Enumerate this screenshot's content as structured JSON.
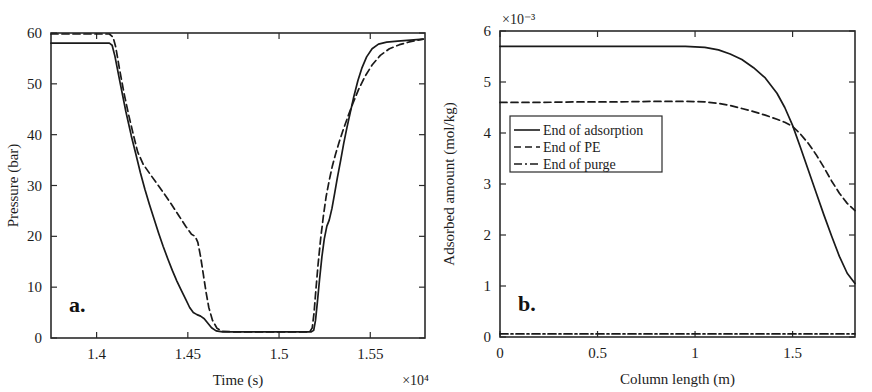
{
  "figure": {
    "width": 872,
    "height": 392,
    "background": "#ffffff",
    "ink_color": "#1a1a1a"
  },
  "chart_data": [
    {
      "id": "panel-a",
      "type": "line",
      "panel_label": "a.",
      "title": "",
      "xlabel": "Time (s)",
      "ylabel": "Pressure (bar)",
      "x_exponent": "×10⁴",
      "y_exponent": "",
      "xlim": [
        13750,
        15800
      ],
      "ylim": [
        0,
        60
      ],
      "xticks": [
        14000,
        14500,
        15000,
        15500
      ],
      "xticklabels": [
        "1.4",
        "1.45",
        "1.5",
        "1.55"
      ],
      "yticks": [
        0,
        10,
        20,
        30,
        40,
        50,
        60
      ],
      "yticklabels": [
        "0",
        "10",
        "20",
        "30",
        "40",
        "50",
        "60"
      ],
      "grid": false,
      "legend": "none",
      "series": [
        {
          "name": "solid-pressure",
          "style": "solid",
          "points": [
            [
              13750,
              58.0
            ],
            [
              13980,
              58.0
            ],
            [
              14070,
              58.0
            ],
            [
              14085,
              57.6
            ],
            [
              14100,
              55.5
            ],
            [
              14130,
              50.0
            ],
            [
              14160,
              44.6
            ],
            [
              14190,
              39.8
            ],
            [
              14215,
              36.2
            ],
            [
              14240,
              32.5
            ],
            [
              14265,
              29.2
            ],
            [
              14290,
              26.2
            ],
            [
              14315,
              23.4
            ],
            [
              14340,
              20.6
            ],
            [
              14365,
              18.0
            ],
            [
              14390,
              15.6
            ],
            [
              14415,
              13.3
            ],
            [
              14440,
              11.2
            ],
            [
              14465,
              9.3
            ],
            [
              14490,
              7.5
            ],
            [
              14510,
              6.0
            ],
            [
              14530,
              5.0
            ],
            [
              14550,
              4.6
            ],
            [
              14570,
              4.3
            ],
            [
              14590,
              3.8
            ],
            [
              14610,
              2.9
            ],
            [
              14630,
              2.0
            ],
            [
              14655,
              1.4
            ],
            [
              14690,
              1.2
            ],
            [
              14800,
              1.2
            ],
            [
              14960,
              1.2
            ],
            [
              15100,
              1.2
            ],
            [
              15175,
              1.2
            ],
            [
              15190,
              1.5
            ],
            [
              15200,
              3.5
            ],
            [
              15210,
              7.0
            ],
            [
              15222,
              11.5
            ],
            [
              15235,
              16.0
            ],
            [
              15248,
              19.5
            ],
            [
              15262,
              22.0
            ],
            [
              15275,
              23.2
            ],
            [
              15290,
              25.5
            ],
            [
              15305,
              28.5
            ],
            [
              15320,
              31.6
            ],
            [
              15338,
              35.0
            ],
            [
              15355,
              38.4
            ],
            [
              15372,
              41.4
            ],
            [
              15390,
              44.3
            ],
            [
              15410,
              47.5
            ],
            [
              15432,
              50.6
            ],
            [
              15455,
              53.2
            ],
            [
              15480,
              55.3
            ],
            [
              15510,
              56.9
            ],
            [
              15545,
              57.8
            ],
            [
              15590,
              58.2
            ],
            [
              15650,
              58.4
            ],
            [
              15720,
              58.6
            ],
            [
              15790,
              58.8
            ]
          ]
        },
        {
          "name": "dashed-pressure",
          "style": "dashed",
          "points": [
            [
              13750,
              59.8
            ],
            [
              13990,
              59.8
            ],
            [
              14070,
              59.8
            ],
            [
              14090,
              59.2
            ],
            [
              14105,
              57.2
            ],
            [
              14125,
              53.0
            ],
            [
              14150,
              48.2
            ],
            [
              14175,
              44.0
            ],
            [
              14200,
              40.2
            ],
            [
              14225,
              36.6
            ],
            [
              14255,
              34.2
            ],
            [
              14290,
              32.4
            ],
            [
              14330,
              30.4
            ],
            [
              14370,
              28.4
            ],
            [
              14410,
              26.3
            ],
            [
              14450,
              24.1
            ],
            [
              14490,
              21.9
            ],
            [
              14520,
              20.4
            ],
            [
              14540,
              20.0
            ],
            [
              14555,
              18.8
            ],
            [
              14570,
              16.0
            ],
            [
              14585,
              12.5
            ],
            [
              14600,
              9.0
            ],
            [
              14615,
              6.0
            ],
            [
              14635,
              3.5
            ],
            [
              14660,
              1.9
            ],
            [
              14690,
              1.3
            ],
            [
              14760,
              1.2
            ],
            [
              14900,
              1.2
            ],
            [
              15060,
              1.2
            ],
            [
              15150,
              1.2
            ],
            [
              15168,
              1.2
            ],
            [
              15182,
              2.0
            ],
            [
              15192,
              5.0
            ],
            [
              15202,
              9.5
            ],
            [
              15214,
              14.5
            ],
            [
              15228,
              19.5
            ],
            [
              15243,
              24.0
            ],
            [
              15258,
              27.8
            ],
            [
              15275,
              31.0
            ],
            [
              15292,
              33.8
            ],
            [
              15310,
              36.2
            ],
            [
              15330,
              38.6
            ],
            [
              15352,
              41.0
            ],
            [
              15378,
              43.6
            ],
            [
              15405,
              46.2
            ],
            [
              15435,
              48.8
            ],
            [
              15470,
              51.4
            ],
            [
              15510,
              53.7
            ],
            [
              15555,
              55.6
            ],
            [
              15605,
              56.9
            ],
            [
              15660,
              57.7
            ],
            [
              15720,
              58.3
            ],
            [
              15790,
              58.8
            ]
          ]
        }
      ]
    },
    {
      "id": "panel-b",
      "type": "line",
      "panel_label": "b.",
      "title": "",
      "xlabel": "Column length (m)",
      "ylabel": "Adsorbed amount (mol/kg)",
      "x_exponent": "",
      "y_exponent": "×10⁻³",
      "xlim": [
        0,
        1.82
      ],
      "ylim": [
        0,
        6
      ],
      "xticks": [
        0,
        0.5,
        1,
        1.5
      ],
      "xticklabels": [
        "0",
        "0.5",
        "1",
        "1.5"
      ],
      "yticks": [
        0,
        1,
        2,
        3,
        4,
        5,
        6
      ],
      "yticklabels": [
        "0",
        "1",
        "2",
        "3",
        "4",
        "5",
        "6"
      ],
      "grid": false,
      "legend": "upper-left-inset",
      "series": [
        {
          "name": "End of adsorption",
          "style": "solid",
          "points": [
            [
              0.0,
              5.7
            ],
            [
              0.2,
              5.7
            ],
            [
              0.4,
              5.7
            ],
            [
              0.6,
              5.7
            ],
            [
              0.8,
              5.7
            ],
            [
              0.95,
              5.7
            ],
            [
              1.05,
              5.68
            ],
            [
              1.12,
              5.63
            ],
            [
              1.18,
              5.55
            ],
            [
              1.24,
              5.44
            ],
            [
              1.3,
              5.28
            ],
            [
              1.36,
              5.08
            ],
            [
              1.42,
              4.78
            ],
            [
              1.46,
              4.5
            ],
            [
              1.5,
              4.15
            ],
            [
              1.54,
              3.72
            ],
            [
              1.58,
              3.28
            ],
            [
              1.62,
              2.84
            ],
            [
              1.66,
              2.4
            ],
            [
              1.7,
              1.98
            ],
            [
              1.74,
              1.58
            ],
            [
              1.78,
              1.25
            ],
            [
              1.82,
              1.05
            ]
          ]
        },
        {
          "name": "End of PE",
          "style": "dashed",
          "points": [
            [
              0.0,
              4.6
            ],
            [
              0.2,
              4.6
            ],
            [
              0.4,
              4.61
            ],
            [
              0.6,
              4.61
            ],
            [
              0.8,
              4.62
            ],
            [
              0.95,
              4.62
            ],
            [
              1.05,
              4.61
            ],
            [
              1.12,
              4.58
            ],
            [
              1.18,
              4.54
            ],
            [
              1.24,
              4.48
            ],
            [
              1.3,
              4.42
            ],
            [
              1.36,
              4.35
            ],
            [
              1.42,
              4.27
            ],
            [
              1.46,
              4.21
            ],
            [
              1.5,
              4.13
            ],
            [
              1.54,
              3.98
            ],
            [
              1.58,
              3.8
            ],
            [
              1.62,
              3.58
            ],
            [
              1.66,
              3.33
            ],
            [
              1.7,
              3.06
            ],
            [
              1.74,
              2.82
            ],
            [
              1.78,
              2.62
            ],
            [
              1.82,
              2.48
            ]
          ]
        },
        {
          "name": "End of purge",
          "style": "dashdot",
          "points": [
            [
              0.0,
              0.06
            ],
            [
              0.3,
              0.06
            ],
            [
              0.6,
              0.06
            ],
            [
              0.9,
              0.06
            ],
            [
              1.2,
              0.06
            ],
            [
              1.5,
              0.06
            ],
            [
              1.82,
              0.06
            ]
          ]
        }
      ],
      "legend_entries": [
        {
          "label": "End of adsorption",
          "style": "solid"
        },
        {
          "label": "End of PE",
          "style": "dashed"
        },
        {
          "label": "End of purge",
          "style": "dashdot"
        }
      ]
    }
  ]
}
